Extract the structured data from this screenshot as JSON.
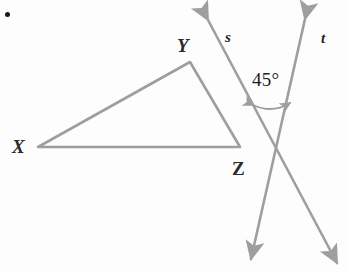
{
  "figure": {
    "kind": "geometry-diagram",
    "background_color": "#fdfdfd",
    "stroke_color": "#9e9e9e",
    "text_color": "#1f1f1f",
    "stroke_width": 2.6
  },
  "bullet": {
    "name": "problem-bullet",
    "x": 5,
    "y": 12,
    "color": "#1a1a1a"
  },
  "triangle": {
    "name": "triangle-XYZ",
    "vertices": [
      {
        "id": "X",
        "label": "X",
        "x": 38,
        "y": 147,
        "label_x": 12,
        "label_y": 138
      },
      {
        "id": "Y",
        "label": "Y",
        "x": 190,
        "y": 62,
        "label_x": 176,
        "label_y": 38
      },
      {
        "id": "Z",
        "label": "Z",
        "x": 240,
        "y": 147,
        "label_x": 231,
        "label_y": 160
      }
    ],
    "edges": [
      "XY",
      "YZ",
      "ZX"
    ]
  },
  "rays": [
    {
      "id": "s",
      "label": "s",
      "label_x": 224,
      "label_y": 30,
      "tip_top": {
        "x": 205,
        "y": 17
      },
      "tip_bottom": {
        "x": 340,
        "y": 266
      },
      "description": "double-headed ray s, rises to upper-left"
    },
    {
      "id": "t",
      "label": "t",
      "label_x": 320,
      "label_y": 30,
      "tip_top": {
        "x": 308,
        "y": 16
      },
      "tip_bottom": {
        "x": 249,
        "y": 262
      },
      "description": "double-headed ray t, rises to upper-right"
    }
  ],
  "intersection": {
    "name": "rays-intersection-point",
    "x": 277,
    "y": 152
  },
  "angle": {
    "name": "angle-45",
    "value": "45°",
    "measure": 45,
    "unit": "degrees",
    "label_x": 252,
    "label_y": 68,
    "arc": {
      "start": {
        "x": 252,
        "y": 106
      },
      "end": {
        "x": 291,
        "y": 103
      },
      "double_headed": true
    }
  }
}
